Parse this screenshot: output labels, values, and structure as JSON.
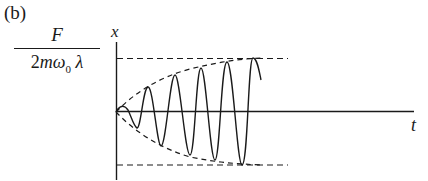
{
  "figure": {
    "panel_label": "(b)",
    "amplitude_label": {
      "numerator": "F",
      "denominator_prefix": "2",
      "denominator_m": "m",
      "denominator_omega": "ω",
      "denominator_subscript": "0",
      "denominator_lambda": "λ"
    },
    "y_axis_label": "x",
    "x_axis_label": "t"
  },
  "colors": {
    "ink": "#1a1a1a",
    "background": "#ffffff"
  }
}
